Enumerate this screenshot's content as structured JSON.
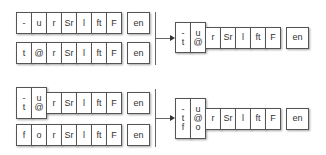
{
  "panels": [
    {
      "inputs": [
        {
          "cells": [
            "-",
            "u",
            "r",
            "Sr",
            "l",
            "ft",
            "F"
          ],
          "end": "en"
        },
        {
          "cells": [
            "t",
            "@",
            "r",
            "Sr",
            "l",
            "ft",
            "F"
          ],
          "end": "en"
        }
      ],
      "output": {
        "stacked": [
          [
            "-",
            "t"
          ],
          [
            "u",
            "@"
          ]
        ],
        "cells": [
          "r",
          "Sr",
          "l",
          "ft",
          "F"
        ],
        "end": "en"
      }
    },
    {
      "inputs": [
        {
          "stacked": [
            [
              "-",
              "t"
            ],
            [
              "u",
              "@"
            ]
          ],
          "cells": [
            "r",
            "Sr",
            "l",
            "ft",
            "F"
          ],
          "end": "en"
        },
        {
          "cells": [
            "f",
            "o",
            "r",
            "Sr",
            "l",
            "ft",
            "F"
          ],
          "end": "en"
        }
      ],
      "output": {
        "stacked": [
          [
            "-",
            "t",
            "f"
          ],
          [
            "u",
            "@",
            "o"
          ]
        ],
        "cells": [
          "r",
          "Sr",
          "l",
          "ft",
          "F"
        ],
        "end": "en"
      }
    }
  ]
}
